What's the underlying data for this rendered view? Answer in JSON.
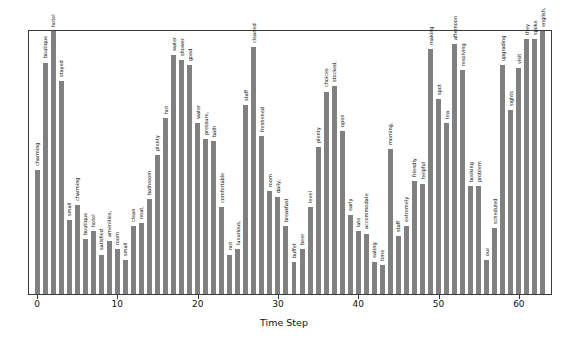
{
  "chart_data": {
    "type": "bar",
    "title": "",
    "subtitle": "",
    "xlabel": "Time Step",
    "ylabel": "",
    "grid": false,
    "legend": null,
    "bar_color": "#808080",
    "axis_color": "#3a3a3a",
    "background": "#ffffff",
    "xlim": [
      -1,
      64
    ],
    "ylim": [
      0,
      1.0
    ],
    "x_ticks": [
      0,
      10,
      20,
      30,
      40,
      50,
      60
    ],
    "x_tick_labels": [
      "0",
      "10",
      "20",
      "30",
      "40",
      "50",
      "60"
    ],
    "y_ticks": [],
    "y_tick_labels": [],
    "point_labels_rotation": 90,
    "x": [
      0,
      1,
      2,
      3,
      4,
      5,
      6,
      7,
      8,
      9,
      10,
      11,
      12,
      13,
      14,
      15,
      16,
      17,
      18,
      19,
      20,
      21,
      22,
      23,
      24,
      25,
      26,
      27,
      28,
      29,
      30,
      31,
      32,
      33,
      34,
      35,
      36,
      37,
      38,
      39,
      40,
      41,
      42,
      43,
      44,
      45,
      46,
      47,
      48,
      49,
      50,
      51,
      52,
      53,
      54,
      55,
      56,
      57,
      58,
      59,
      60,
      61,
      62,
      63
    ],
    "categories": [
      "charming",
      "boutique",
      "hotel",
      "stayed",
      "small",
      "charming",
      "boutique",
      "hotel",
      "satisfied",
      "amenities,",
      "room",
      "small",
      "clean",
      "neat,",
      "bathroom",
      "plenty",
      "hot",
      "water",
      "shower",
      "good",
      "water",
      "pressure,",
      "bath",
      "comfortable",
      "not",
      "luxurious,",
      "staff",
      "cleaned",
      "freshened",
      "room",
      "daily,",
      "breakfast",
      "buffet",
      "beer",
      "level",
      "plenty",
      "choices",
      "stocked,",
      "open",
      "early",
      "late",
      "accommodate",
      "eating",
      "time",
      "morning,",
      "staff",
      "extremely",
      "friendly",
      "helpful",
      "making",
      "spot",
      "tea",
      "afternoon",
      "resolving",
      "booking",
      "problem",
      "our",
      "scheduled",
      "upgrading",
      "sights",
      "visit",
      "they",
      "spoke",
      "english,"
    ],
    "values": [
      0.47,
      0.88,
      1.0,
      0.81,
      0.28,
      0.34,
      0.21,
      0.24,
      0.15,
      0.2,
      0.17,
      0.13,
      0.26,
      0.27,
      0.36,
      0.53,
      0.67,
      0.91,
      0.89,
      0.87,
      0.65,
      0.59,
      0.58,
      0.33,
      0.15,
      0.17,
      0.72,
      0.94,
      0.6,
      0.39,
      0.37,
      0.26,
      0.12,
      0.17,
      0.33,
      0.56,
      0.77,
      0.79,
      0.62,
      0.3,
      0.24,
      0.23,
      0.12,
      0.11,
      0.55,
      0.22,
      0.26,
      0.43,
      0.42,
      0.93,
      0.74,
      0.65,
      0.95,
      0.85,
      0.41,
      0.41,
      0.13,
      0.25,
      0.87,
      0.7,
      0.86,
      0.97,
      0.97,
      1.0
    ]
  }
}
